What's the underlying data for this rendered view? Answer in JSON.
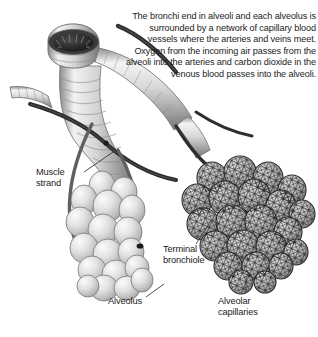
{
  "figure": {
    "background_color": "#ffffff",
    "width": 318,
    "height": 337
  },
  "caption": {
    "text": "The bronchi end in alveoli and each alveolus is surrounded by a network of capillary blood vessels where the arteries and veins meet. Oxygen from the incoming air passes from the alveoli into the arteries and carbon dioxide in the venous blood passes into the alveoli."
  },
  "labels": {
    "muscle_strand": "Muscle\nstrand",
    "terminal_bronchiole": "Terminal\nbronchiole",
    "alveolus": "Alveolus",
    "alveolar_capillaries": "Alveolar\ncapillaries"
  },
  "colors": {
    "text": "#1b1b1b",
    "leader_line": "#333333",
    "vessel_dark": "#2b2b2b",
    "vessel_mid": "#6f6f6f",
    "alveolus_light": "#e9e9e9",
    "alveolus_shade": "#b9b9b9",
    "bronchus_light": "#f0f0f0",
    "bronchus_shade": "#9a9a9a",
    "capillary_mesh": "#1f1f1f"
  }
}
